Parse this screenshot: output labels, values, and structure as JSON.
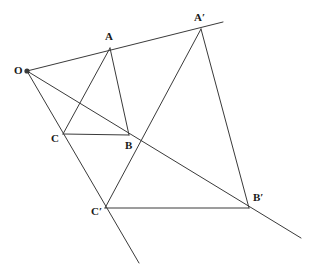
{
  "figure": {
    "width": 309,
    "height": 276,
    "background_color": "#ffffff",
    "stroke_color": "#3a3a3a",
    "stroke_width": 1,
    "label_color": "#1a1a1a",
    "label_font_size": 11
  },
  "points": {
    "O": {
      "label": "O",
      "x": 27,
      "y": 71,
      "label_x": 14,
      "label_y": 65,
      "dot": true,
      "dot_radius": 2.6
    },
    "A": {
      "label": "A",
      "x": 110,
      "y": 48,
      "label_x": 105,
      "label_y": 31,
      "dot": false
    },
    "B": {
      "label": "B",
      "x": 129,
      "y": 135,
      "label_x": 125,
      "label_y": 140,
      "dot": false
    },
    "C": {
      "label": "C",
      "x": 63,
      "y": 134,
      "label_x": 51,
      "label_y": 133,
      "dot": false
    },
    "Ap": {
      "label": "A′",
      "x": 201,
      "y": 29,
      "label_x": 194,
      "label_y": 12,
      "dot": false
    },
    "Bp": {
      "label": "B′",
      "x": 249,
      "y": 208,
      "label_x": 253,
      "label_y": 192,
      "dot": false
    },
    "Cp": {
      "label": "C′",
      "x": 105,
      "y": 208,
      "label_x": 91,
      "label_y": 206,
      "dot": false
    }
  },
  "segments": [
    {
      "name": "triangle-abc-side-ab",
      "x1": 110,
      "y1": 48,
      "x2": 129,
      "y2": 135
    },
    {
      "name": "triangle-abc-side-bc",
      "x1": 129,
      "y1": 135,
      "x2": 63,
      "y2": 134
    },
    {
      "name": "triangle-abc-side-ca",
      "x1": 63,
      "y1": 134,
      "x2": 110,
      "y2": 48
    },
    {
      "name": "triangle-apbpcp-side-ab",
      "x1": 201,
      "y1": 29,
      "x2": 249,
      "y2": 208
    },
    {
      "name": "triangle-apbpcp-side-bc",
      "x1": 249,
      "y1": 208,
      "x2": 105,
      "y2": 208
    },
    {
      "name": "triangle-apbpcp-side-ca",
      "x1": 105,
      "y1": 208,
      "x2": 201,
      "y2": 29
    }
  ],
  "rays": [
    {
      "name": "ray-o-through-a-to-ap",
      "x1": 27,
      "y1": 71,
      "x2": 223,
      "y2": 22
    },
    {
      "name": "ray-o-through-b-to-bp",
      "x1": 27,
      "y1": 71,
      "x2": 301,
      "y2": 238
    },
    {
      "name": "ray-o-through-c-to-cp",
      "x1": 27,
      "y1": 71,
      "x2": 139,
      "y2": 263
    }
  ]
}
